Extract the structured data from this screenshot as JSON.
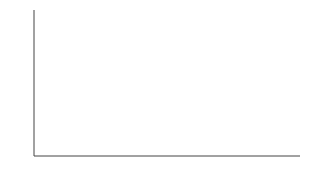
{
  "chart_data": {
    "type": "bar",
    "title": "",
    "xlabel": "",
    "ylabel": "Time",
    "categories": [
      "High-fat diet",
      "Mixed diet",
      "High-carbohydrate diet"
    ],
    "category_lines": [
      [
        "High-fat",
        "diet"
      ],
      [
        "Mixed",
        "diet"
      ],
      [
        "High-carbohydrate",
        "diet"
      ]
    ],
    "values": [
      1.0,
      2.0,
      2.4
    ],
    "value_units": "relative (no numeric axis shown)",
    "ylim": [
      0,
      2.9
    ],
    "grid": false,
    "legend": null,
    "bar_fill": "stippled pattern"
  },
  "colors": {
    "axis": "#444444",
    "bar_edge": "#555555",
    "pattern": "#888888"
  }
}
